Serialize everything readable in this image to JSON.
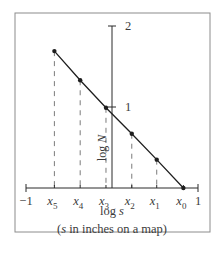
{
  "chart_data": {
    "type": "line",
    "title": "",
    "xlabel": "log s",
    "xlabel_note": "(s in inches on a map)",
    "ylabel": "log N",
    "xlim": [
      -1,
      1
    ],
    "ylim": [
      0,
      2
    ],
    "x_ticks": [
      {
        "value": -1,
        "label": "−1"
      },
      {
        "value": 1,
        "label": "1"
      }
    ],
    "y_ticks": [
      {
        "value": 1,
        "label": "1"
      },
      {
        "value": 2,
        "label": "2"
      }
    ],
    "grid": false,
    "legend": "none",
    "series": [
      {
        "name": "log N vs log s",
        "points": [
          {
            "label": "x5",
            "sub": "5",
            "x": -0.67,
            "y": 1.69
          },
          {
            "label": "x4",
            "sub": "4",
            "x": -0.37,
            "y": 1.33
          },
          {
            "label": "x3",
            "sub": "3",
            "x": -0.07,
            "y": 0.99
          },
          {
            "label": "x2",
            "sub": "2",
            "x": 0.23,
            "y": 0.67
          },
          {
            "label": "x1",
            "sub": "1",
            "x": 0.52,
            "y": 0.35
          },
          {
            "label": "x0",
            "sub": "0",
            "x": 0.83,
            "y": 0.0
          }
        ]
      }
    ],
    "colors": {
      "line": "#1e1e1e",
      "axis": "#2a2a2a",
      "dash": "#7a7a7a",
      "frame": "#8c8c8c"
    }
  }
}
